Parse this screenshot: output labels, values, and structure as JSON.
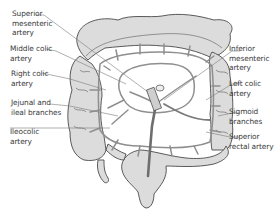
{
  "diagram": {
    "colors": {
      "intestine_fill": "#dcdcdc",
      "intestine_outline": "#4a4a4a",
      "artery": "#8f8f8f",
      "artery_dark": "#6e6e6e",
      "leader_line": "#7a7a7a",
      "label_text": "#3a3a3a",
      "background": "#ffffff"
    },
    "labels_left": [
      {
        "line1": "Superior",
        "line2": "mesenteric",
        "line3": "artery"
      },
      {
        "line1": "Middle colic",
        "line2": "artery"
      },
      {
        "line1": "Right colic",
        "line2": "artery"
      },
      {
        "line1": "Jejunal and",
        "line2": "ileal branches"
      },
      {
        "line1": "Ileocolic",
        "line2": "artery"
      }
    ],
    "labels_right": [
      {
        "line1": "Inferior",
        "line2": "mesenteric",
        "line3": "artery"
      },
      {
        "line1": "Left colic",
        "line2": "artery"
      },
      {
        "line1": "Sigmoid",
        "line2": "branches"
      },
      {
        "line1": "Superior",
        "line2": "rectal artery"
      }
    ]
  }
}
